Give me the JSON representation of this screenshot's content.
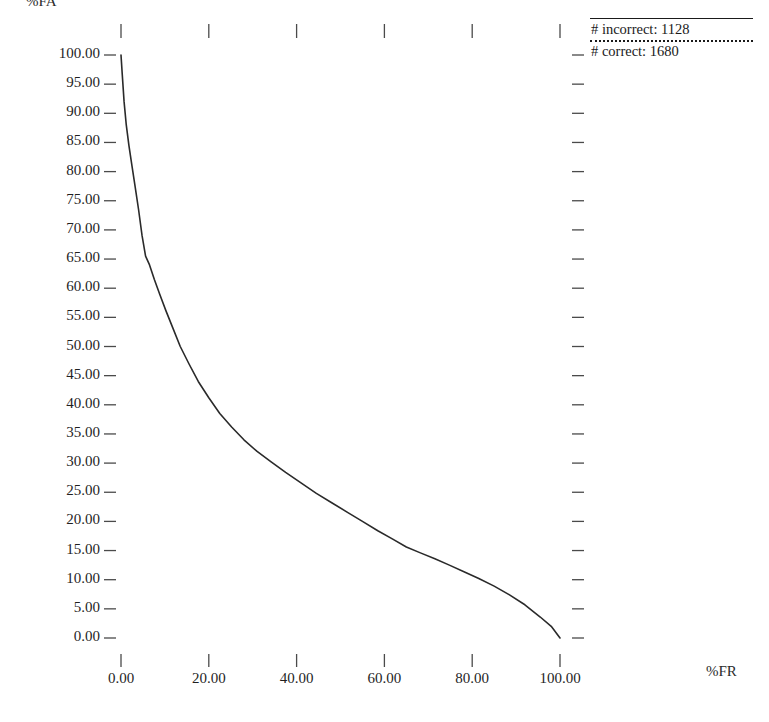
{
  "chart_data": {
    "type": "line",
    "title": "",
    "xlabel": "%FR",
    "ylabel": "%FA",
    "xlim": [
      0,
      100
    ],
    "ylim": [
      0,
      100
    ],
    "grid": false,
    "legend_position": "top-right",
    "x_ticks": [
      "0.00",
      "20.00",
      "40.00",
      "60.00",
      "80.00",
      "100.00"
    ],
    "x_tick_values": [
      0,
      20,
      40,
      60,
      80,
      100
    ],
    "y_ticks": [
      "100.00",
      "95.00",
      "90.00",
      "85.00",
      "80.00",
      "75.00",
      "70.00",
      "65.00",
      "60.00",
      "55.00",
      "50.00",
      "45.00",
      "40.00",
      "35.00",
      "30.00",
      "25.00",
      "20.00",
      "15.00",
      "10.00",
      "5.00",
      "0.00"
    ],
    "y_tick_values": [
      100,
      95,
      90,
      85,
      80,
      75,
      70,
      65,
      60,
      55,
      50,
      45,
      40,
      35,
      30,
      25,
      20,
      15,
      10,
      5,
      0
    ],
    "series": [
      {
        "name": "DET curve",
        "style": "solid",
        "color": "#2a2a2a",
        "x": [
          0.0,
          0.3,
          0.7,
          1.2,
          1.8,
          2.5,
          3.2,
          4.0,
          4.8,
          5.6,
          6.5,
          7.6,
          8.8,
          10.2,
          11.8,
          13.5,
          15.5,
          17.6,
          20.0,
          22.5,
          25.2,
          28.0,
          31.0,
          34.2,
          37.5,
          41.0,
          44.5,
          48.0,
          51.5,
          55.0,
          58.5,
          61.8,
          65.0,
          68.2,
          71.5,
          74.8,
          78.0,
          81.5,
          85.0,
          88.5,
          92.0,
          95.5,
          98.0,
          100.0
        ],
        "y": [
          100.0,
          96.5,
          92.0,
          88.0,
          84.5,
          81.0,
          77.5,
          73.5,
          69.0,
          65.5,
          64.0,
          61.5,
          59.0,
          56.2,
          53.2,
          50.0,
          47.0,
          44.0,
          41.2,
          38.5,
          36.2,
          34.0,
          32.0,
          30.2,
          28.4,
          26.6,
          24.8,
          23.2,
          21.6,
          20.0,
          18.4,
          17.0,
          15.6,
          14.6,
          13.6,
          12.5,
          11.4,
          10.2,
          8.9,
          7.4,
          5.7,
          3.6,
          2.0,
          0.0
        ]
      }
    ],
    "legend": [
      {
        "label": "# incorrect: 1128",
        "style": "solid",
        "value": 1128
      },
      {
        "label": "# correct: 1680",
        "style": "dotted",
        "value": 1680
      }
    ]
  },
  "axes": {
    "y_title": "%FA",
    "x_title": "%FR"
  },
  "colors": {
    "curve": "#2a2a2a",
    "tick": "#4a4a4a",
    "text": "#1a1a1a",
    "background": "#ffffff"
  }
}
